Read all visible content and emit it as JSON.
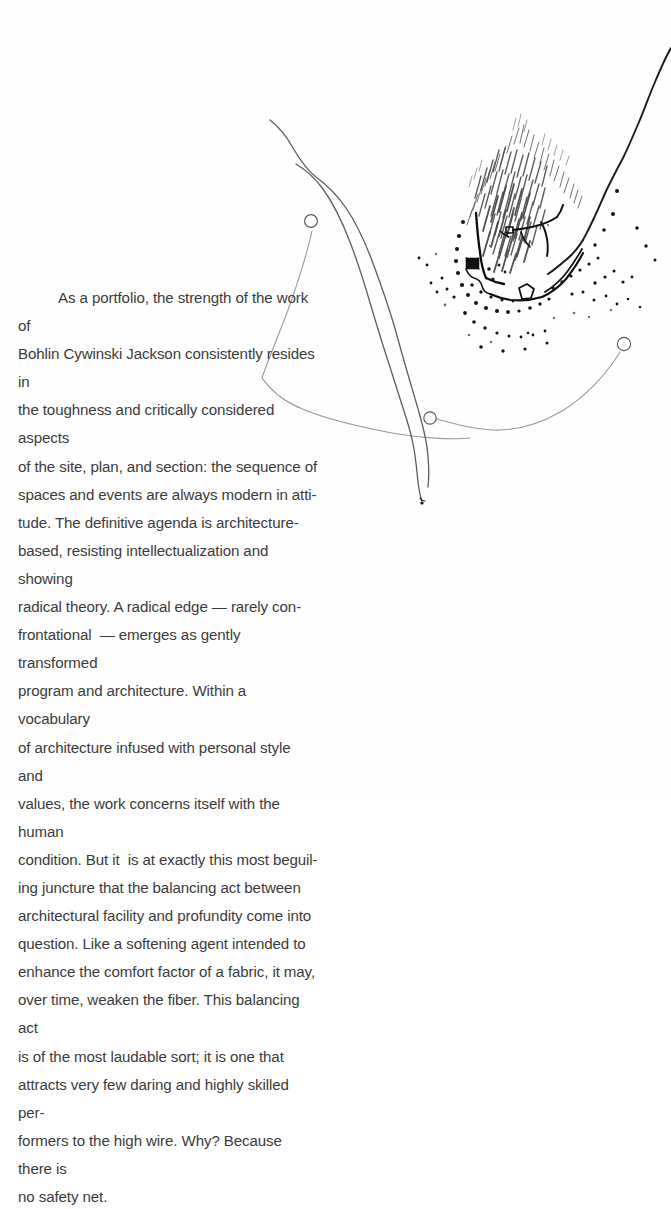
{
  "page": {
    "kind": "scanned-portfolio-page",
    "background_color": "#ffffff",
    "text_color": "#3b3b3b"
  },
  "essay": {
    "lines": [
      "As a portfolio, the strength of the work of",
      "Bohlin Cywinski Jackson consistently resides in",
      "the toughness and critically considered aspects",
      "of the site, plan, and section: the sequence of",
      "spaces and events are always modern in atti-",
      "tude. The definitive agenda is architecture-",
      "based, resisting intellectualization and showing",
      "radical theory. A radical edge — rarely con-",
      "frontational  — emerges as gently transformed",
      "program and architecture. Within a vocabulary",
      "of architecture infused with personal style and",
      "values, the work concerns itself with the human",
      "condition. But it  is at exactly this most beguil-",
      "ing juncture that the balancing act between",
      "architectural facility and profundity come into",
      "question. Like a softening agent intended to",
      "enhance the comfort factor of a fabric, it may,",
      "over time, weaken the fiber. This balancing act",
      "is of the most laudable sort; it is one that",
      "attracts very few daring and highly skilled per-",
      "formers to the high wire. Why? Because there is",
      "no safety net."
    ],
    "full_text": "As a portfolio, the strength of the work of Bohlin Cywinski Jackson consistently resides in the toughness and critically considered aspects of the site, plan, and section: the sequence of spaces and events are always modern in attitude. The definitive agenda is architecture-based, resisting intellectualization and showing radical theory. A radical edge — rarely confrontational — emerges as gently transformed program and architecture. Within a vocabulary of architecture infused with personal style and values, the work concerns itself with the human condition. But it is at exactly this most beguiling juncture that the balancing act between architectural facility and profundity come into question. Like a softening agent intended to enhance the comfort factor of a fabric, it may, over time, weaken the fiber. This balancing act is of the most laudable sort; it is one that attracts very few daring and highly skilled performers to the high wire. Why? Because there is no safety net."
  },
  "drawing": {
    "title": "hand-drawn architectural site plan",
    "ink_dark": "#1a1a1a",
    "ink_mid": "#5d5d5d",
    "ink_light": "#9a9a9a",
    "elements": [
      "road-double-curve",
      "contour-line-ridge",
      "vegetation-scribble-mass",
      "building-footprint",
      "tree-dot-field",
      "path-arc-with-nodes"
    ],
    "node_markers": 3
  }
}
